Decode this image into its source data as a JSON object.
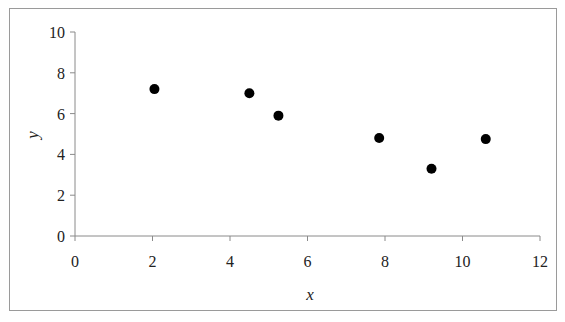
{
  "chart_data": {
    "type": "scatter",
    "title": "",
    "xlabel": "x",
    "ylabel": "y",
    "xlim": [
      0,
      12
    ],
    "ylim": [
      0,
      10
    ],
    "x_ticks": [
      0,
      2,
      4,
      6,
      8,
      10,
      12
    ],
    "y_ticks": [
      0,
      2,
      4,
      6,
      8,
      10
    ],
    "grid": false,
    "legend": null,
    "series": [
      {
        "name": "data",
        "marker": "circle",
        "color": "#000000",
        "points": [
          {
            "x": 2.05,
            "y": 7.2
          },
          {
            "x": 4.5,
            "y": 7.0
          },
          {
            "x": 5.25,
            "y": 5.9
          },
          {
            "x": 7.85,
            "y": 4.8
          },
          {
            "x": 9.2,
            "y": 3.3
          },
          {
            "x": 10.6,
            "y": 4.75
          }
        ]
      }
    ]
  },
  "labels": {
    "x_axis_title": "x",
    "y_axis_title": "y"
  },
  "colors": {
    "axis": "#8a8a8a",
    "marker": "#000000",
    "frame": "#9a9a9a"
  }
}
